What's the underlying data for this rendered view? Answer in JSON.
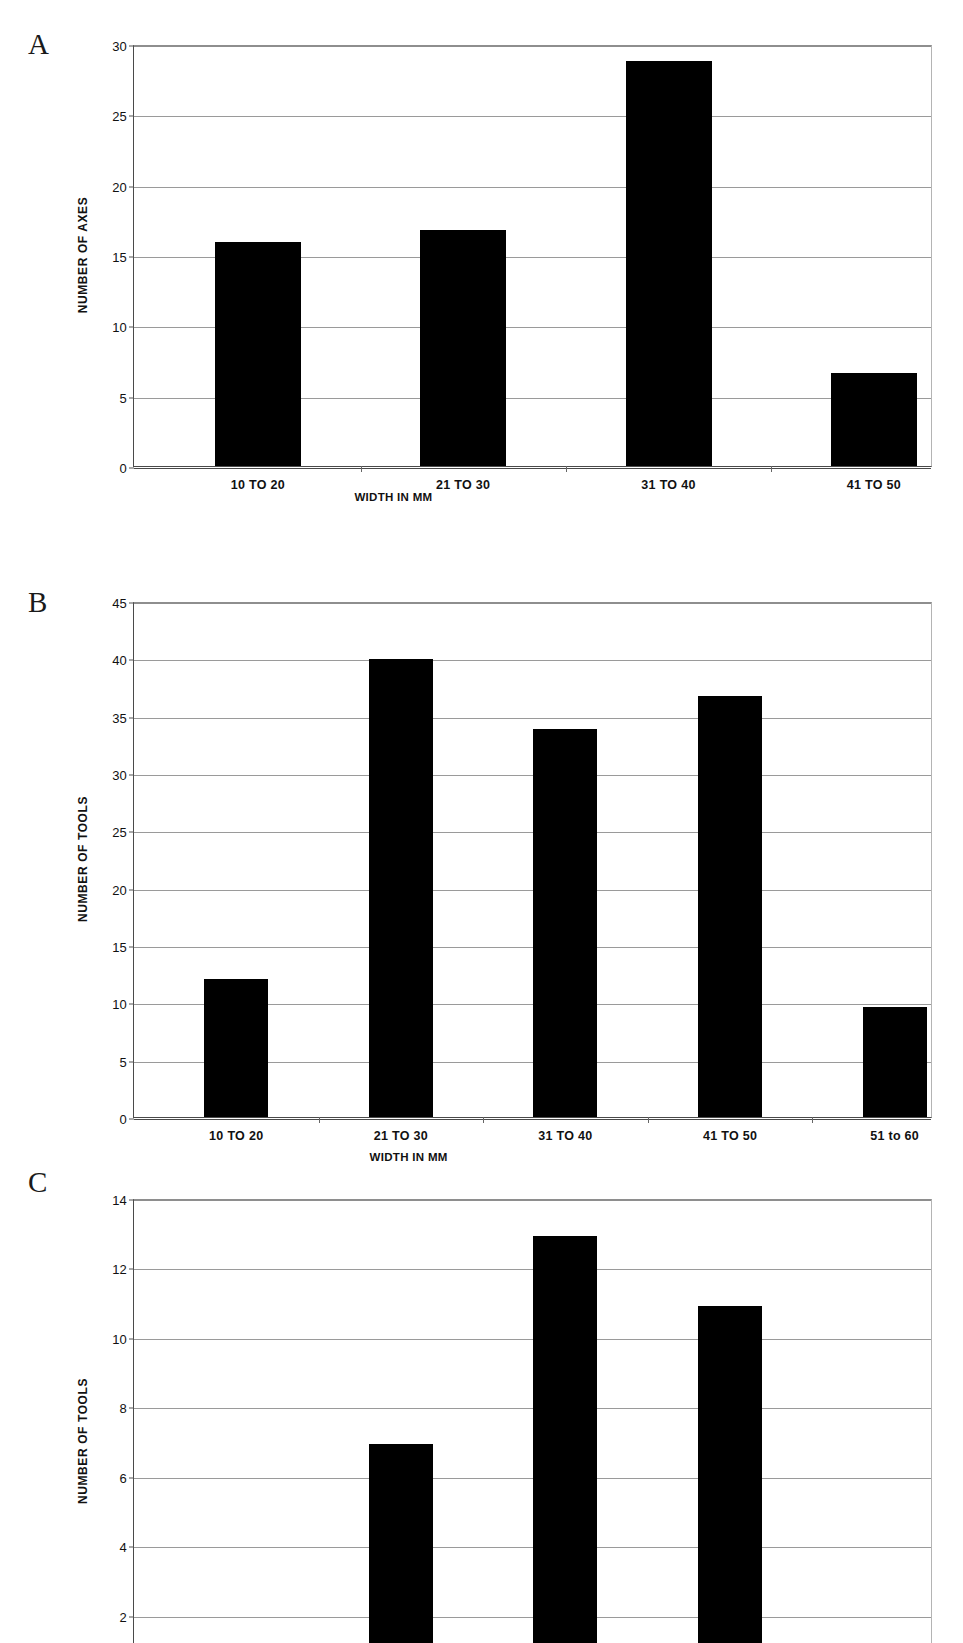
{
  "figure": {
    "panels": [
      {
        "letter": "A"
      },
      {
        "letter": "B"
      },
      {
        "letter": "C"
      }
    ]
  },
  "chart_data": [
    {
      "id": "A",
      "type": "bar",
      "title": "",
      "xlabel": "WIDTH IN MM",
      "ylabel": "NUMBER OF AXES",
      "categories": [
        "10 TO 20",
        "21 TO 30",
        "31 TO 40",
        "41 TO 50"
      ],
      "values": [
        15.9,
        16.8,
        28.8,
        6.6
      ],
      "ylim": [
        0,
        30
      ],
      "yticks": [
        0,
        5,
        10,
        15,
        20,
        25,
        30
      ],
      "ytick_labels": [
        "0",
        "5",
        "10",
        "15",
        "20",
        "25",
        "30"
      ],
      "grid": true,
      "legend": "none",
      "bar_color": "#000000"
    },
    {
      "id": "B",
      "type": "bar",
      "title": "",
      "xlabel": "WIDTH IN MM",
      "ylabel": "NUMBER OF TOOLS",
      "categories": [
        "10 TO 20",
        "21 TO 30",
        "31 TO 40",
        "41 TO 50",
        "51 to 60"
      ],
      "values": [
        12.0,
        39.9,
        33.8,
        36.7,
        9.6
      ],
      "ylim": [
        0,
        45
      ],
      "yticks": [
        0,
        5,
        10,
        15,
        20,
        25,
        30,
        35,
        40,
        45
      ],
      "ytick_labels": [
        "0",
        "5",
        "10",
        "15",
        "20",
        "25",
        "30",
        "35",
        "40",
        "45"
      ],
      "grid": true,
      "legend": "none",
      "bar_color": "#000000"
    },
    {
      "id": "C",
      "type": "bar",
      "title": "",
      "xlabel": "",
      "ylabel": "NUMBER OF TOOLS",
      "categories": [
        "",
        "",
        "",
        "",
        ""
      ],
      "values": [
        1.0,
        6.9,
        12.9,
        10.9,
        1.0
      ],
      "ylim": [
        0,
        14
      ],
      "yticks": [
        0,
        2,
        4,
        6,
        8,
        10,
        12,
        14
      ],
      "ytick_labels": [
        "0",
        "2",
        "4",
        "6",
        "8",
        "10",
        "12",
        "14"
      ],
      "grid": true,
      "legend": "none",
      "bar_color": "#000000",
      "note": "bottom of panel cropped by image edge"
    }
  ]
}
